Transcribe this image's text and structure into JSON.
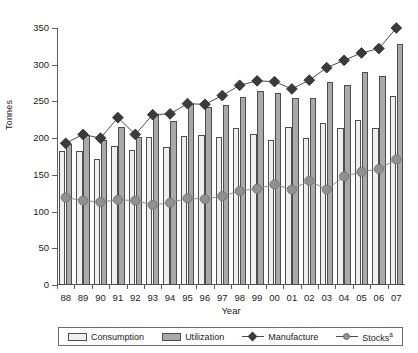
{
  "chart_data": {
    "type": "bar",
    "title": "",
    "xlabel": "Year",
    "ylabel": "Tonnes",
    "ylim": [
      0,
      350
    ],
    "yticks": [
      0,
      50,
      100,
      150,
      200,
      250,
      300,
      350
    ],
    "grid": false,
    "legend_position": "bottom",
    "categories": [
      "88",
      "89",
      "90",
      "91",
      "92",
      "93",
      "94",
      "95",
      "96",
      "97",
      "98",
      "99",
      "00",
      "01",
      "02",
      "03",
      "04",
      "05",
      "06",
      "07"
    ],
    "series": [
      {
        "name": "Consumption",
        "kind": "bar",
        "color": "#efefef",
        "values": [
          182,
          182,
          171,
          190,
          184,
          201,
          188,
          203,
          204,
          201,
          214,
          205,
          197,
          215,
          200,
          221,
          214,
          225,
          214,
          258
        ]
      },
      {
        "name": "Utilization",
        "kind": "bar",
        "color": "#a9a9a9",
        "values": [
          192,
          204,
          198,
          215,
          201,
          231,
          224,
          246,
          243,
          245,
          256,
          264,
          262,
          255,
          255,
          277,
          273,
          290,
          284,
          328
        ]
      },
      {
        "name": "Manufacture",
        "kind": "line-diamond",
        "color": "#3b3b3b",
        "values": [
          193,
          205,
          200,
          228,
          205,
          232,
          233,
          247,
          246,
          258,
          272,
          278,
          277,
          267,
          279,
          296,
          306,
          316,
          322,
          350
        ]
      },
      {
        "name": "Stocks",
        "name_superscript": "a",
        "kind": "line-circle",
        "color": "#909090",
        "values": [
          119,
          115,
          113,
          116,
          115,
          109,
          112,
          118,
          117,
          121,
          128,
          131,
          137,
          130,
          142,
          130,
          148,
          154,
          158,
          171
        ]
      }
    ]
  },
  "legend": {
    "items": [
      {
        "label": "Consumption",
        "marker": "bar-light"
      },
      {
        "label": "Utilization",
        "marker": "bar-dark"
      },
      {
        "label": "Manufacture",
        "marker": "line-diamond"
      },
      {
        "label": "Stocks",
        "superscript": "a",
        "marker": "line-circle"
      }
    ]
  },
  "colors": {
    "consumption": "#efefef",
    "utilization": "#a9a9a9",
    "manufacture": "#3b3b3b",
    "stocks": "#909090",
    "axis": "#5d5d5d",
    "text": "#1a1a1a",
    "background": "#ffffff"
  }
}
